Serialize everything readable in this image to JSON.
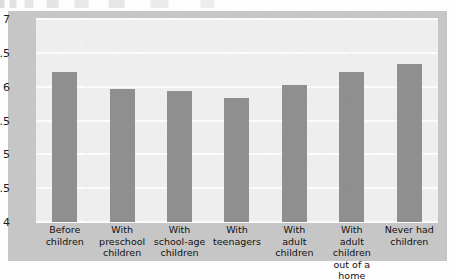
{
  "figure": {
    "frame_color": "#c6c6c6",
    "plot_background": "#eeeeee",
    "bar_color": "#8f8f8f",
    "gridline_color": "#fbfbfb"
  },
  "chart_data": {
    "type": "bar",
    "title": "",
    "xlabel": "",
    "ylabel": "",
    "ylim": [
      4,
      7
    ],
    "yticks": [
      "7",
      "6.5",
      "6",
      "5.5",
      "5",
      "4.5",
      "4"
    ],
    "ytick_values": [
      7,
      6.5,
      6,
      5.5,
      5,
      4.5,
      4
    ],
    "grid": true,
    "legend": "none",
    "categories": [
      "Before children",
      "With preschool children",
      "With school-age children",
      "With teenagers",
      "With adult children",
      "With adult children out of a home",
      "Never had children"
    ],
    "category_lines": [
      [
        "Before",
        "children"
      ],
      [
        "With",
        "preschool",
        "children"
      ],
      [
        "With",
        "school-age",
        "children"
      ],
      [
        "With",
        "teenagers"
      ],
      [
        "With",
        "adult",
        "children"
      ],
      [
        "With",
        "adult children",
        "out of a home"
      ],
      [
        "Never had",
        "children"
      ]
    ],
    "values": [
      6.22,
      5.97,
      5.93,
      5.84,
      6.03,
      6.22,
      6.34
    ]
  }
}
